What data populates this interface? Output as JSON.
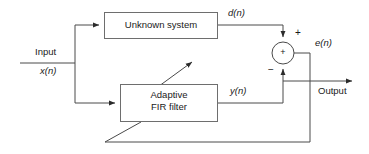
{
  "diagram": {
    "blocks": [
      {
        "id": "unknown-system",
        "label": "Unknown system",
        "x": 104,
        "y": 12,
        "w": 114,
        "h": 27
      },
      {
        "id": "adaptive-fir-filter",
        "label_line1": "Adaptive",
        "label_line2": "FIR filter",
        "x": 120,
        "y": 84,
        "w": 98,
        "h": 38
      }
    ],
    "signals": {
      "input_label": "Input",
      "input_signal": "x(n)",
      "desired_signal": "d(n)",
      "filter_output_signal": "y(n)",
      "error_signal": "e(n)",
      "output_label": "Output"
    },
    "summing_junction": {
      "id": "summing-junction",
      "inner_symbol": "+",
      "positive_sign": "+",
      "negative_sign": "−",
      "cx": 283,
      "cy": 53,
      "r": 11
    },
    "colors": {
      "line": "#3f3f3f",
      "box_stroke": "#6e6e6e",
      "text": "#1a1a1a",
      "background": "#ffffff"
    }
  }
}
